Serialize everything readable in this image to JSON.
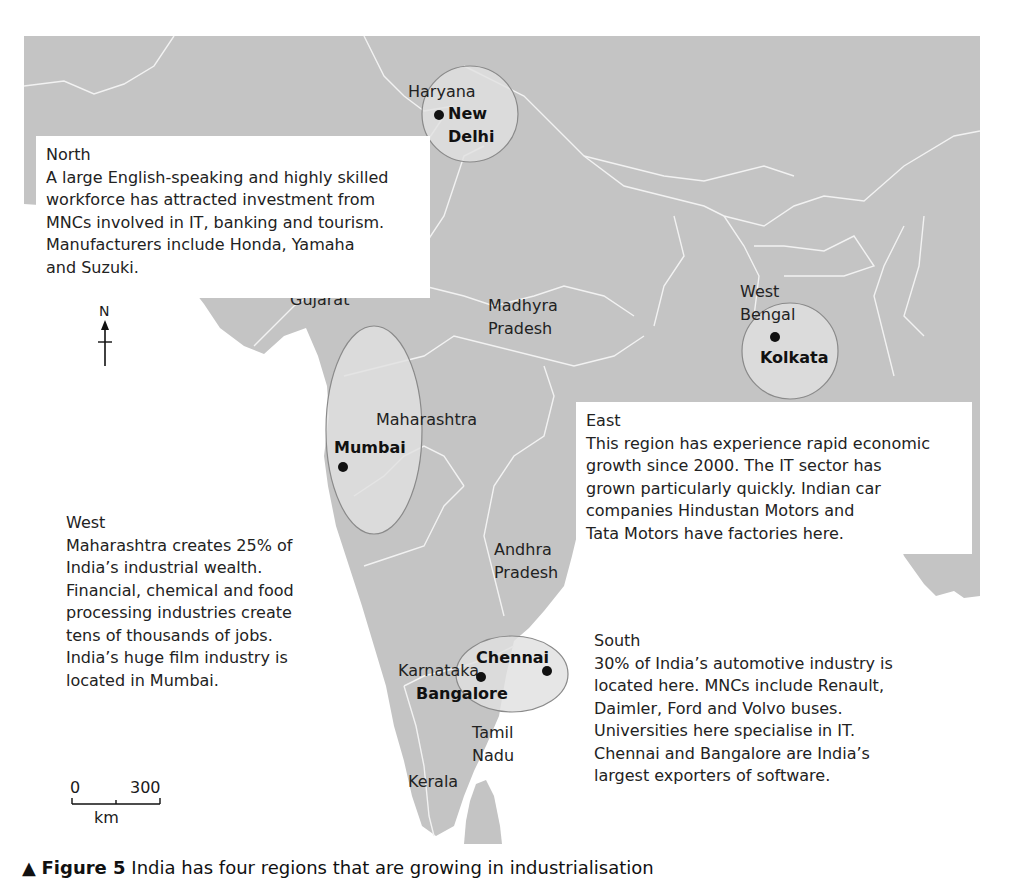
{
  "map": {
    "colors": {
      "land": "#c4c4c4",
      "sea": "#ffffff",
      "borders": "#f2f2f2",
      "highlight_circle": "#e0e0e0",
      "highlight_stroke": "#8a8a8a",
      "text": "#222222"
    },
    "state_labels": [
      {
        "name": "Haryana"
      },
      {
        "name": "Gujarat"
      },
      {
        "name": "Madhyra Pradesh"
      },
      {
        "name": "West Bengal"
      },
      {
        "name": "Maharashtra"
      },
      {
        "name": "Andhra Pradesh"
      },
      {
        "name": "Karnataka"
      },
      {
        "name": "Tamil Nadu"
      },
      {
        "name": "Kerala"
      }
    ],
    "state_label_lines": {
      "haryana": "Haryana",
      "gujarat": "Gujarat",
      "madhya_1": "Madhyra",
      "madhya_2": "Pradesh",
      "wb_1": "West",
      "wb_2": "Bengal",
      "maharashtra": "Maharashtra",
      "andhra_1": "Andhra",
      "andhra_2": "Pradesh",
      "karnataka": "Karnataka",
      "tamil_1": "Tamil",
      "tamil_2": "Nadu",
      "kerala": "Kerala"
    },
    "cities": {
      "new_delhi_1": "New",
      "new_delhi_2": "Delhi",
      "kolkata": "Kolkata",
      "mumbai": "Mumbai",
      "chennai": "Chennai",
      "bangalore": "Bangalore"
    },
    "north_arrow": {
      "label": "N"
    },
    "scale_bar": {
      "start": "0",
      "end": "300",
      "unit": "km"
    }
  },
  "regions": {
    "north": {
      "title": "North",
      "body": "A large English-speaking and highly skilled\nworkforce has attracted investment from\nMNCs involved in IT, banking and tourism.\nManufacturers include Honda, Yamaha\nand Suzuki."
    },
    "east": {
      "title": "East",
      "body": "This region has experience rapid economic\ngrowth since 2000. The IT sector has\ngrown particularly quickly. Indian car\ncompanies Hindustan Motors and\nTata Motors have factories here."
    },
    "west": {
      "title": "West",
      "body": "Maharashtra creates 25% of\nIndia’s industrial wealth.\nFinancial, chemical and food\nprocessing industries create\ntens of thousands of jobs.\nIndia’s huge film industry is\nlocated in Mumbai."
    },
    "south": {
      "title": "South",
      "body": "30% of India’s automotive industry is\nlocated here. MNCs include Renault,\nDaimler, Ford and Volvo buses.\nUniversities here specialise in IT.\nChennai and Bangalore are India’s\nlargest exporters of software."
    }
  },
  "caption": {
    "marker": "▲",
    "figure": "Figure 5",
    "text": "India has four regions that are growing in industrialisation"
  }
}
